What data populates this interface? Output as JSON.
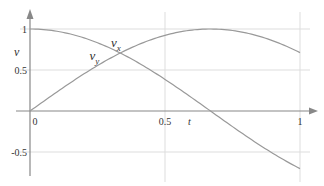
{
  "chart_data": {
    "type": "line",
    "title": "",
    "xlabel": "t",
    "ylabel": "v",
    "xlim": [
      0,
      1
    ],
    "ylim": [
      -0.8,
      1.1
    ],
    "grid": true,
    "x_ticks": [
      {
        "value": 0,
        "label": "0"
      },
      {
        "value": 0.5,
        "label": "0.5"
      },
      {
        "value": 1,
        "label": "1"
      }
    ],
    "y_ticks": [
      {
        "value": 1,
        "label": "1"
      },
      {
        "value": 0.5,
        "label": "0.5"
      },
      {
        "value": -0.5,
        "label": "-0.5"
      }
    ],
    "series": [
      {
        "name": "v_x",
        "label_main": "v",
        "label_sub": "x",
        "label_at": {
          "t": 0.3,
          "v": 0.78
        },
        "x": [
          0,
          0.1,
          0.2,
          0.3,
          0.4,
          0.5,
          0.6,
          0.654,
          0.7,
          0.8,
          0.9,
          1.0
        ],
        "values": [
          1.0,
          0.973,
          0.891,
          0.758,
          0.587,
          0.388,
          0.156,
          0.0,
          -0.105,
          -0.3,
          -0.53,
          -0.7
        ]
      },
      {
        "name": "v_y",
        "label_main": "v",
        "label_sub": "y",
        "label_at": {
          "t": 0.22,
          "v": 0.62
        },
        "x": [
          0,
          0.1,
          0.2,
          0.3,
          0.4,
          0.5,
          0.6,
          0.668,
          0.7,
          0.8,
          0.9,
          1.0
        ],
        "values": [
          0.0,
          0.23,
          0.455,
          0.653,
          0.81,
          0.923,
          0.988,
          1.0,
          0.997,
          0.953,
          0.848,
          0.711
        ]
      }
    ],
    "colors": {
      "axis": "#888888",
      "grid": "#dddddd",
      "curve": "#999999",
      "text": "#333333"
    }
  }
}
